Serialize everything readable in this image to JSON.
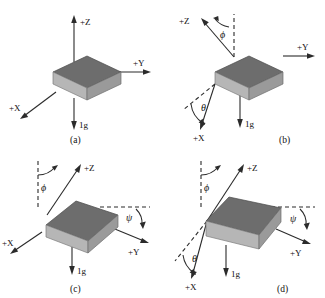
{
  "figure": {
    "title": "",
    "background_color": "#ffffff",
    "block_colors": {
      "top_face": "#6d6d6d",
      "front_face": "#b6b6b6",
      "side_face": "#9a9a9a",
      "line_color": "#2b2b2b"
    }
  },
  "labels": {
    "axis_x": "+X",
    "axis_y": "+Y",
    "axis_z": "+Z",
    "gravity": "1g",
    "angle_phi": "ϕ",
    "angle_theta": "θ",
    "angle_psi": "ψ"
  },
  "panels": [
    {
      "id": "a",
      "caption": "(a)",
      "description": "Level block, unrotated reference orientation",
      "axes": [
        "+Z",
        "+Y",
        "+X"
      ],
      "gravity_label": "1g",
      "angles": []
    },
    {
      "id": "b",
      "caption": "(b)",
      "description": "Block with Z axis tilted by phi and X axis tilted by theta",
      "axes": [
        "+Z",
        "+Y",
        "+X"
      ],
      "gravity_label": "1g",
      "angles": [
        "ϕ",
        "θ"
      ]
    },
    {
      "id": "c",
      "caption": "(c)",
      "description": "Block with Z axis tilted by phi and Y axis tilted by psi",
      "axes": [
        "+Z",
        "+Y",
        "+X"
      ],
      "gravity_label": "1g",
      "angles": [
        "ϕ",
        "ψ"
      ]
    },
    {
      "id": "d",
      "caption": "(d)",
      "description": "Block rotated with phi, theta and psi angles",
      "axes": [
        "+Z",
        "+Y",
        "+X"
      ],
      "gravity_label": "1g",
      "angles": [
        "ϕ",
        "θ",
        "ψ"
      ]
    }
  ]
}
